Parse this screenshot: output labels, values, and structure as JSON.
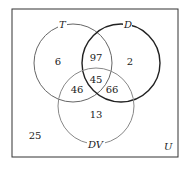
{
  "diagram": {
    "type": "venn-3",
    "universe_label": "U",
    "sets": [
      {
        "name": "T",
        "label": "T"
      },
      {
        "name": "D",
        "label": "D"
      },
      {
        "name": "DV",
        "label": "DV"
      }
    ],
    "regions": {
      "T_only": "6",
      "D_only": "2",
      "DV_only": "13",
      "T_and_D_only": "97",
      "T_and_DV_only": "46",
      "D_and_DV_only": "66",
      "T_and_D_and_DV": "45",
      "none": "25"
    }
  }
}
